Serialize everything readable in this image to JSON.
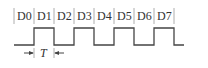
{
  "diagram": {
    "type": "timing-diagram",
    "bit_labels": [
      "D0",
      "D1",
      "D2",
      "D3",
      "D4",
      "D5",
      "D6",
      "D7"
    ],
    "period_label": "T",
    "waveform_levels": [
      0,
      1,
      0,
      1,
      0,
      1,
      0,
      1,
      0
    ],
    "colors": {
      "line": "#444444",
      "separator": "#999999",
      "text": "#333333"
    }
  }
}
